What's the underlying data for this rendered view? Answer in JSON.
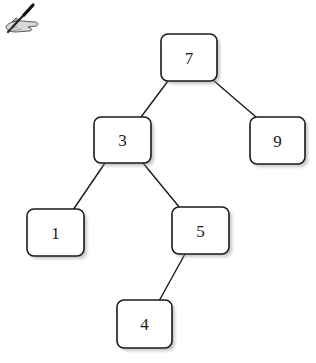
{
  "diagram": {
    "type": "binary-search-tree",
    "nodes": [
      {
        "id": "n7",
        "label": "7"
      },
      {
        "id": "n3",
        "label": "3"
      },
      {
        "id": "n9",
        "label": "9"
      },
      {
        "id": "n1",
        "label": "1"
      },
      {
        "id": "n5",
        "label": "5"
      },
      {
        "id": "n4",
        "label": "4"
      }
    ],
    "edges": [
      {
        "from": "n7",
        "to": "n3"
      },
      {
        "from": "n7",
        "to": "n9"
      },
      {
        "from": "n3",
        "to": "n1"
      },
      {
        "from": "n3",
        "to": "n5"
      },
      {
        "from": "n5",
        "to": "n4"
      }
    ]
  },
  "icons": {
    "corner": "hand-writing-pen-icon"
  }
}
